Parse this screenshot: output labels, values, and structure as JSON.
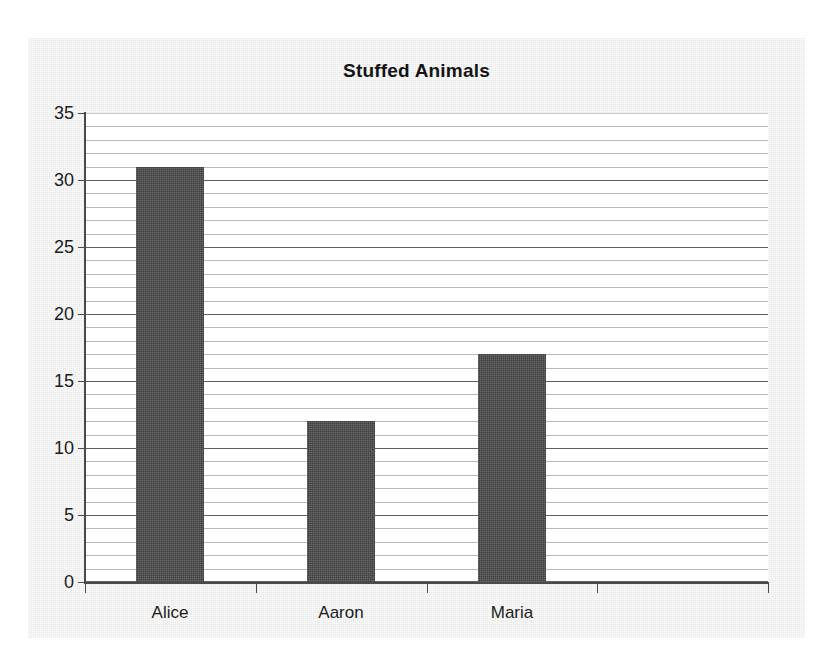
{
  "chart_data": {
    "type": "bar",
    "title": "Stuffed Animals",
    "xlabel": "",
    "ylabel": "",
    "categories": [
      "Alice",
      "Aaron",
      "Maria",
      ""
    ],
    "values": [
      31,
      12,
      17,
      null
    ],
    "series": [
      {
        "name": "Stuffed Animals",
        "values": [
          31,
          12,
          17,
          null
        ]
      }
    ],
    "ylim": [
      0,
      35
    ],
    "y_ticks": [
      0,
      5,
      10,
      15,
      20,
      25,
      30,
      35
    ],
    "y_tick_labels": [
      "0",
      "5",
      "10",
      "15",
      "20",
      "25",
      "30",
      "35"
    ],
    "y_major_interval": 5,
    "y_minor_interval": 1,
    "grid": {
      "horizontal": true,
      "vertical": false,
      "minor_gridlines": true
    },
    "legend": {
      "visible": false,
      "position": "none"
    },
    "colors": {
      "bar_fill": "#3f3f3f",
      "plot_background": "#ffffff",
      "chart_background": "#e9e9e9",
      "major_gridline": "#5f5f5f",
      "minor_gridline": "#b9b9b9",
      "axis_line": "#4a4a4a",
      "text": "#1c1c1c",
      "title_text": "#141414"
    },
    "bar_count": 3,
    "category_slots": 4,
    "annotations": []
  }
}
